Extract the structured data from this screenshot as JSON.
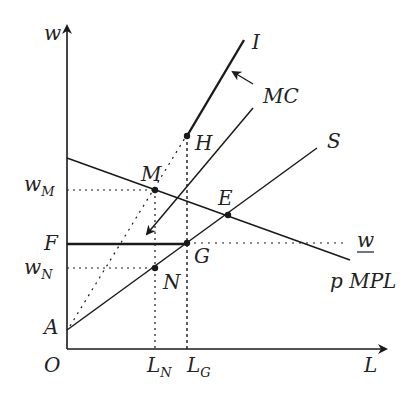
{
  "diagram": {
    "type": "economics-labor-market",
    "axes": {
      "y_label": "w",
      "x_label": "L",
      "origin_label": "O"
    },
    "y_tick_labels": {
      "wM": {
        "base": "w",
        "sub": "M"
      },
      "F": "F",
      "wN": {
        "base": "w",
        "sub": "N"
      },
      "A": "A"
    },
    "x_tick_labels": {
      "LN": {
        "base": "L",
        "sub": "N"
      },
      "LG": {
        "base": "L",
        "sub": "G"
      }
    },
    "curves": {
      "I": "I",
      "MC": "MC",
      "S": "S",
      "pMPL": "p MPL",
      "w_min": "w"
    },
    "points": {
      "M": "M",
      "H": "H",
      "E": "E",
      "G": "G",
      "N": "N"
    },
    "colors": {
      "ink": "#1a1a1a",
      "background": "#ffffff"
    }
  }
}
